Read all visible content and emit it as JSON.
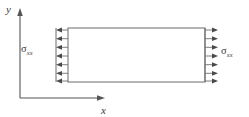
{
  "figure": {
    "type": "mechanics-stress-diagram",
    "background_color": "#ffffff",
    "line_color": "#6b6b6b",
    "axis_color": "#555555",
    "text_color": "#3a3a3a"
  },
  "axes": {
    "y_axis": {
      "label": "y",
      "direction": "up",
      "x": 20,
      "y_start": 98,
      "y_end": 10,
      "label_x": 8,
      "label_y": 13
    },
    "x_axis": {
      "label": "x",
      "direction": "right",
      "y": 98,
      "x_start": 20,
      "x_end": 104,
      "label_x": 102,
      "label_y": 114
    }
  },
  "body": {
    "shape": "rectangle",
    "left": 68,
    "top": 28,
    "right": 205,
    "bottom": 82,
    "fill": "#ffffff",
    "stroke": "#6b6b6b"
  },
  "loads": {
    "left": {
      "label_symbol": "σ",
      "label_subscript": "xx",
      "arrow_count": 7,
      "direction": "left",
      "tail_x": 68,
      "tip_x": 56,
      "bar_x": 56,
      "bar_top": 28,
      "bar_bottom": 82
    },
    "right": {
      "label_symbol": "σ",
      "label_subscript": "xx",
      "arrow_count": 7,
      "direction": "right",
      "tail_x": 205,
      "tip_x": 218,
      "bar_x": 205,
      "bar_top": 28,
      "bar_bottom": 82
    },
    "arrow_rows_y": [
      30,
      38.7,
      47.3,
      56,
      64.7,
      73.3,
      81
    ]
  }
}
